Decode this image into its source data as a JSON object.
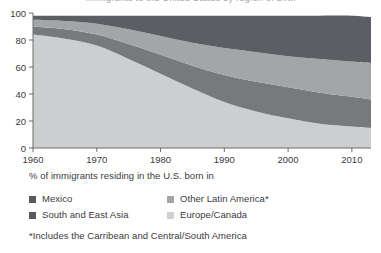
{
  "figure": {
    "clipped_title": "Immigrants to the United States by region of birth",
    "caption_line": "% of immigrants residing in the U.S. born in",
    "footnote": "*Includes the Carribean and Central/South America"
  },
  "legend": {
    "items": [
      {
        "label": "Mexico",
        "color": "#575a5e",
        "swatch_name": "legend-swatch-mexico"
      },
      {
        "label": "Other Latin America*",
        "color": "#a3a5a7",
        "swatch_name": "legend-swatch-other-latin-america"
      },
      {
        "label": "South and East Asia",
        "color": "#575a5e",
        "swatch_name": "legend-swatch-south-and-east-asia"
      },
      {
        "label": "Europe/Canada",
        "color": "#cdcecf",
        "swatch_name": "legend-swatch-europe-canada"
      }
    ]
  },
  "axes": {
    "y_ticks": [
      "0",
      "20",
      "40",
      "60",
      "80",
      "100"
    ],
    "x_ticks": [
      "1960",
      "1970",
      "1980",
      "1990",
      "2000",
      "2010"
    ]
  },
  "colors": {
    "europe_canada": "#cdcecf",
    "mexico": "#767a7d",
    "other_latin_america": "#a3a5a7",
    "south_east_asia": "#5b5e62",
    "axis": "#6d6d6d",
    "text": "#3b3a3e",
    "background": "#ffffff"
  },
  "chart_data": {
    "type": "area",
    "stacked": true,
    "title": "",
    "xlabel": "",
    "ylabel": "",
    "xlim": [
      1960,
      2013
    ],
    "ylim": [
      0,
      100
    ],
    "grid": false,
    "legend_position": "below",
    "x": [
      1960,
      1965,
      1970,
      1975,
      1980,
      1985,
      1990,
      1995,
      2000,
      2005,
      2010,
      2013
    ],
    "series": [
      {
        "name": "Europe/Canada",
        "color": "#cdcecf",
        "values": [
          84,
          81,
          76,
          66,
          55,
          44,
          34,
          27,
          22,
          18,
          16,
          15
        ]
      },
      {
        "name": "Mexico",
        "color": "#767a7d",
        "values": [
          6,
          7,
          8,
          11,
          14,
          17,
          20,
          22,
          23,
          23,
          22,
          21
        ]
      },
      {
        "name": "Other Latin America*",
        "color": "#a3a5a7",
        "values": [
          5,
          6,
          8,
          11,
          14,
          17,
          20,
          22,
          23,
          25,
          26,
          27
        ]
      },
      {
        "name": "South and East Asia",
        "color": "#5b5e62",
        "values": [
          3,
          4,
          6,
          10,
          15,
          20,
          24,
          27,
          30,
          32,
          34,
          34
        ]
      }
    ],
    "cumulative_upper_bounds": {
      "europe_canada": [
        84,
        81,
        76,
        66,
        55,
        44,
        34,
        27,
        22,
        18,
        16,
        15
      ],
      "mexico": [
        90,
        88,
        84,
        77,
        69,
        61,
        54,
        49,
        45,
        41,
        38,
        36
      ],
      "other_latin_america": [
        95,
        94,
        92,
        88,
        83,
        78,
        74,
        71,
        68,
        66,
        64,
        63
      ],
      "south_east_asia": [
        98,
        98,
        98,
        98,
        98,
        98,
        98,
        98,
        98,
        98,
        98,
        97
      ]
    }
  }
}
